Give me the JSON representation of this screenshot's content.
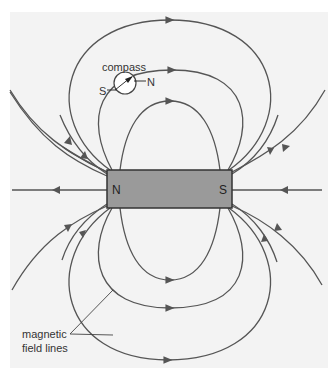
{
  "diagram": {
    "type": "bar-magnet-field",
    "magnet": {
      "north_label": "N",
      "south_label": "S",
      "fill_color": "#9a9a9a"
    },
    "compass": {
      "label": "compass",
      "south_label": "S",
      "north_label": "N"
    },
    "annotation": {
      "line1": "magnetic",
      "line2": "field lines"
    },
    "colors": {
      "background": "#f3f3f3",
      "line": "#555555"
    }
  }
}
